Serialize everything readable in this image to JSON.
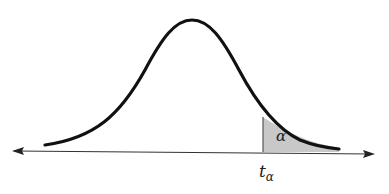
{
  "diagram": {
    "type": "t-distribution upper tail",
    "curve_color": "#111111",
    "shade_color": "#c8c8c8",
    "axis_color": "#333333",
    "labels": {
      "area": "α",
      "critical_value_base": "t",
      "critical_value_sub": "α"
    }
  }
}
